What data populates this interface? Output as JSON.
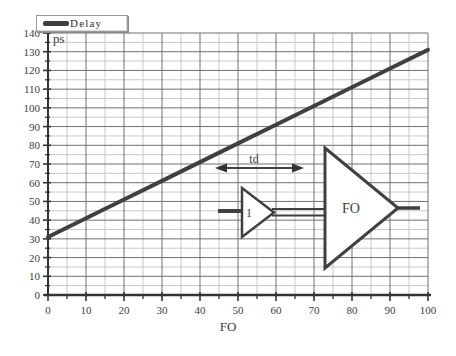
{
  "figure": {
    "background": "#ffffff"
  },
  "legend": {
    "label": "Delay"
  },
  "chart_data": {
    "type": "line",
    "title": "",
    "xlabel": "FO",
    "ylabel": "ps",
    "x": [
      0,
      10,
      20,
      30,
      40,
      50,
      60,
      70,
      80,
      90,
      100
    ],
    "series": [
      {
        "name": "Delay",
        "values": [
          31,
          41,
          51,
          61,
          71,
          81,
          91,
          101,
          111,
          121,
          131
        ],
        "color": "#404040",
        "width": 4
      }
    ],
    "xlim": [
      0,
      100
    ],
    "ylim": [
      0,
      140
    ],
    "x_ticks": [
      0,
      10,
      20,
      30,
      40,
      50,
      60,
      70,
      80,
      90,
      100
    ],
    "y_ticks": [
      0,
      10,
      20,
      30,
      40,
      50,
      60,
      70,
      80,
      90,
      100,
      110,
      120,
      130,
      140
    ],
    "x_minor_step": 5,
    "y_minor_step": 5,
    "grid": {
      "enabled": true,
      "major_color": "#707070",
      "minor_color": "#c8c8c8"
    },
    "axis_color": "#333333",
    "legend_position": "top-left"
  },
  "inset": {
    "small_buffer_label": "1",
    "big_buffer_label": "FO",
    "delay_arrow_label": "td"
  }
}
